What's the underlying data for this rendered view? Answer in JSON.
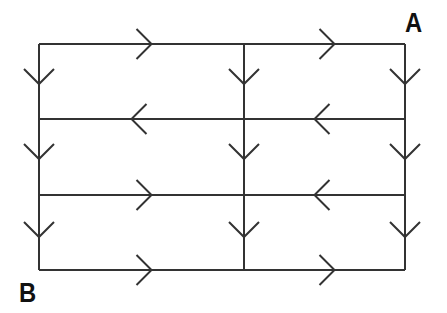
{
  "diagram": {
    "type": "directed grid graph",
    "stroke_color": "#333333",
    "labels": {
      "a": "A",
      "b": "B"
    },
    "grid": {
      "columns_x": [
        39,
        244,
        405
      ],
      "rows_y": [
        44,
        119,
        195,
        270
      ]
    },
    "horizontal_edges": [
      {
        "row": 0,
        "from_col": 0,
        "to_col": 1,
        "direction": "right"
      },
      {
        "row": 0,
        "from_col": 1,
        "to_col": 2,
        "direction": "right"
      },
      {
        "row": 1,
        "from_col": 0,
        "to_col": 1,
        "direction": "left"
      },
      {
        "row": 1,
        "from_col": 1,
        "to_col": 2,
        "direction": "left"
      },
      {
        "row": 2,
        "from_col": 0,
        "to_col": 1,
        "direction": "right"
      },
      {
        "row": 2,
        "from_col": 1,
        "to_col": 2,
        "direction": "left"
      },
      {
        "row": 3,
        "from_col": 0,
        "to_col": 1,
        "direction": "right"
      },
      {
        "row": 3,
        "from_col": 1,
        "to_col": 2,
        "direction": "right"
      }
    ],
    "vertical_edges": [
      {
        "col": 0,
        "from_row": 0,
        "to_row": 1,
        "direction": "down"
      },
      {
        "col": 0,
        "from_row": 1,
        "to_row": 2,
        "direction": "down"
      },
      {
        "col": 0,
        "from_row": 2,
        "to_row": 3,
        "direction": "down"
      },
      {
        "col": 1,
        "from_row": 0,
        "to_row": 1,
        "direction": "down"
      },
      {
        "col": 1,
        "from_row": 1,
        "to_row": 2,
        "direction": "down"
      },
      {
        "col": 1,
        "from_row": 2,
        "to_row": 3,
        "direction": "down"
      },
      {
        "col": 2,
        "from_row": 0,
        "to_row": 1,
        "direction": "down"
      },
      {
        "col": 2,
        "from_row": 1,
        "to_row": 2,
        "direction": "down"
      },
      {
        "col": 2,
        "from_row": 2,
        "to_row": 3,
        "direction": "down"
      }
    ]
  }
}
